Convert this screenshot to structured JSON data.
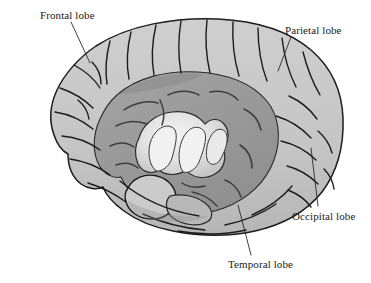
{
  "figure": {
    "kind": "anatomical-illustration",
    "background_color": "#ffffff",
    "outline_color": "#1c1c1c",
    "colors": {
      "cortex_light": "#c7c7c7",
      "cortex_light_shadow": "#b4b4b4",
      "cortex_highlight": "#dcdcdc",
      "inner_medium": "#9b9b9b",
      "inner_dark": "#8a8a8a",
      "insula_bright": "#ededed",
      "insula_mid": "#d2d2d2",
      "leader_line": "#2a2a2a",
      "text": "#1a1a1a"
    }
  },
  "labels": [
    {
      "id": "frontal",
      "text": "Frontal lobe",
      "x": 40,
      "y": 9,
      "leader": {
        "x1": 71,
        "y1": 22,
        "x2": 90,
        "y2": 63
      }
    },
    {
      "id": "parietal",
      "text": "Parietal lobe",
      "x": 285,
      "y": 24,
      "leader": {
        "x1": 291,
        "y1": 37,
        "x2": 278,
        "y2": 71
      }
    },
    {
      "id": "occipital",
      "text": "Occipital lobe",
      "x": 292,
      "y": 210,
      "leader": {
        "x1": 318,
        "y1": 206,
        "x2": 311,
        "y2": 148
      }
    },
    {
      "id": "temporal",
      "text": "Temporal lobe",
      "x": 228,
      "y": 258,
      "leader": {
        "x1": 251,
        "y1": 255,
        "x2": 238,
        "y2": 205
      }
    }
  ]
}
